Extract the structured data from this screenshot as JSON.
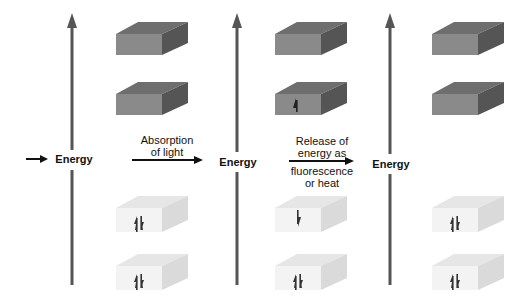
{
  "figure": {
    "axis_label": "Energy",
    "transitions": [
      {
        "label_line1": "Absorption",
        "label_line2": "of light"
      },
      {
        "label_line1": "Release of",
        "label_line2": "energy as",
        "label_line3": "fluorescence",
        "label_line4": "or heat"
      }
    ],
    "states": [
      {
        "name": "ground-state",
        "orbitals": [
          "empty",
          "empty",
          "paired",
          "paired"
        ]
      },
      {
        "name": "excited-state",
        "orbitals": [
          "empty",
          "single-up",
          "single-down",
          "paired"
        ]
      },
      {
        "name": "returned-ground-state",
        "orbitals": [
          "empty",
          "empty",
          "paired",
          "paired"
        ]
      }
    ],
    "colors": {
      "empty_front": "#8a8a8a",
      "empty_top": "#6e6e6e",
      "empty_side": "#5a5a5a",
      "filled_front": "#f2f2f2",
      "filled_top": "#e4e4e4",
      "filled_side": "#d8d8d8",
      "arrow": "#555555"
    }
  }
}
